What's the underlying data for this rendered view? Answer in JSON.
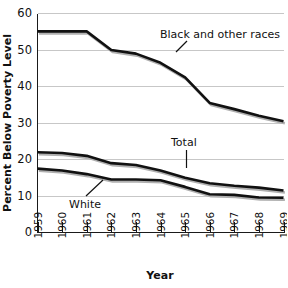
{
  "chart_data": {
    "type": "line",
    "title": "",
    "xlabel": "Year",
    "ylabel": "Percent Below Poverty Level",
    "x": [
      1959,
      1960,
      1961,
      1962,
      1963,
      1964,
      1965,
      1966,
      1967,
      1968,
      1969
    ],
    "xtick_labels": [
      "1959",
      "1960",
      "1961",
      "1962",
      "1963",
      "1964",
      "1965",
      "1966",
      "1967",
      "1968",
      "1969"
    ],
    "xlim": [
      1959,
      1969
    ],
    "ylim": [
      0,
      60
    ],
    "ytick_labels": [
      "0",
      "10",
      "20",
      "30",
      "40",
      "50",
      "60"
    ],
    "ytick_values": [
      0,
      10,
      20,
      30,
      40,
      50,
      60
    ],
    "grid": "horizontal",
    "legend": "inline annotations",
    "series": [
      {
        "name": "Black and other races",
        "values": [
          55.1,
          55.1,
          55.1,
          50.0,
          49.0,
          46.5,
          42.5,
          35.5,
          33.8,
          32.0,
          30.5
        ]
      },
      {
        "name": "Total",
        "values": [
          22.0,
          21.8,
          21.0,
          19.0,
          18.5,
          17.0,
          15.0,
          13.5,
          12.8,
          12.3,
          11.5
        ]
      },
      {
        "name": "White",
        "values": [
          17.5,
          17.0,
          16.0,
          14.5,
          14.5,
          14.3,
          12.5,
          10.5,
          10.3,
          9.6,
          9.5
        ]
      }
    ],
    "annotations": [
      {
        "label": "Black and other races",
        "series": "Black and other races"
      },
      {
        "label": "Total",
        "series": "Total"
      },
      {
        "label": "White",
        "series": "White"
      }
    ]
  },
  "colors": {
    "line": "#111111",
    "line_shadow": "#b0b0b0",
    "gridline": "#b9b9b9",
    "axis": "#1a1a1a",
    "background": "#ffffff"
  }
}
